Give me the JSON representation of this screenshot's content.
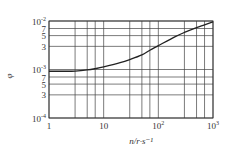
{
  "chart_data": {
    "type": "line",
    "title": "",
    "xlabel": "n/r·s⁻¹",
    "ylabel": "φ",
    "xscale": "log",
    "yscale": "log",
    "xlim": [
      1,
      1000
    ],
    "ylim": [
      0.0001,
      0.01
    ],
    "grid": true,
    "x_ticks": [
      {
        "value": 1,
        "label": "1"
      },
      {
        "value": 10,
        "label": "10"
      },
      {
        "value": 100,
        "label": "10",
        "sup": "2"
      },
      {
        "value": 1000,
        "label": "10",
        "sup": "3"
      }
    ],
    "y_ticks": [
      {
        "value": 0.0001,
        "label": "10",
        "sup": "-4"
      },
      {
        "value": 0.0003,
        "label": "3"
      },
      {
        "value": 0.0005,
        "label": "5"
      },
      {
        "value": 0.0007,
        "label": "7"
      },
      {
        "value": 0.001,
        "label": "10",
        "sup": "-3"
      },
      {
        "value": 0.003,
        "label": "3"
      },
      {
        "value": 0.005,
        "label": "5"
      },
      {
        "value": 0.007,
        "label": "7"
      },
      {
        "value": 0.01,
        "label": "10",
        "sup": "-2"
      }
    ],
    "x_grid": [
      1,
      3,
      5,
      7,
      10,
      30,
      50,
      70,
      100,
      300,
      500,
      700,
      1000
    ],
    "y_grid": [
      0.0001,
      0.0003,
      0.0005,
      0.0007,
      0.001,
      0.003,
      0.005,
      0.007,
      0.01
    ],
    "series": [
      {
        "name": "φ",
        "x": [
          1,
          2,
          3,
          5,
          7,
          10,
          20,
          30,
          50,
          70,
          100,
          200,
          300,
          500,
          700,
          1000
        ],
        "values": [
          0.00092,
          0.00092,
          0.00093,
          0.00098,
          0.00104,
          0.00113,
          0.00138,
          0.0016,
          0.002,
          0.0025,
          0.0031,
          0.0047,
          0.0058,
          0.0073,
          0.0083,
          0.0096
        ]
      }
    ]
  },
  "colors": {
    "line": "#222222",
    "grid": "#444444",
    "text": "#333333"
  }
}
